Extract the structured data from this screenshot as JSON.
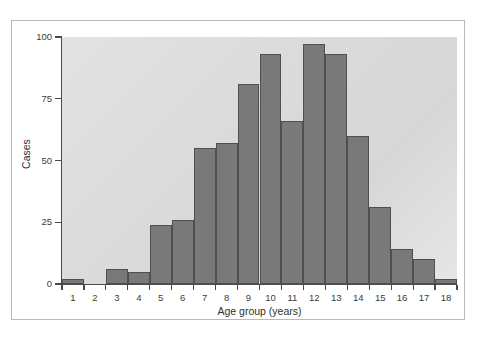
{
  "chart_data": {
    "type": "bar",
    "title": "",
    "subtitle": "",
    "xlabel": "Age group (years)",
    "ylabel": "Cases",
    "categories": [
      "1",
      "2",
      "3",
      "4",
      "5",
      "6",
      "7",
      "8",
      "9",
      "10",
      "11",
      "12",
      "13",
      "14",
      "15",
      "16",
      "17",
      "18"
    ],
    "values": [
      2,
      0,
      6,
      5,
      24,
      26,
      55,
      57,
      81,
      93,
      66,
      97,
      93,
      60,
      31,
      14,
      10,
      2
    ],
    "ylim": [
      0,
      100
    ],
    "yticks": [
      0,
      25,
      50,
      75,
      100
    ],
    "ytick_labels": [
      "0",
      "25",
      "50",
      "75",
      "100"
    ],
    "xlim": [
      0.5,
      18.5
    ],
    "grid": false,
    "legend": null,
    "annotations": [],
    "series": [
      {
        "name": "Cases",
        "values": [
          2,
          0,
          6,
          5,
          24,
          26,
          55,
          57,
          81,
          93,
          66,
          97,
          93,
          60,
          31,
          14,
          10,
          2
        ]
      }
    ]
  },
  "style": {
    "bar_fill": "#797979",
    "bar_stroke": "#4f4f4f",
    "plot_background": "#dcdcdc",
    "figure_background": "#ffffff",
    "axis_color": "#4a4a4a",
    "text_color": "#303030",
    "frame_color": "#b9b9b9"
  }
}
